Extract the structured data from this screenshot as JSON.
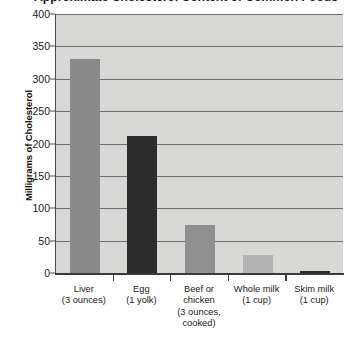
{
  "chart_data": {
    "type": "bar",
    "title": "Approximate Cholesterol Content of Common Foods",
    "title_note": "clipped at top edge of screenshot",
    "xlabel": "",
    "ylabel": "Milligrams of Cholesterol",
    "ylim": [
      0,
      400
    ],
    "ytick_values": [
      0,
      50,
      100,
      150,
      200,
      250,
      300,
      350,
      400
    ],
    "ytick_labels": [
      "0",
      "50",
      "100",
      "150",
      "200",
      "250",
      "300",
      "350",
      "400"
    ],
    "grid": true,
    "legend": "none",
    "categories": [
      "Liver\n(3 ounces)",
      "Egg\n(1 yolk)",
      "Beef or chicken\n(3 ounces, cooked)",
      "Whole milk\n(1 cup)",
      "Skim milk\n(1 cup)"
    ],
    "category_lines": [
      [
        "Liver",
        "(3 ounces)"
      ],
      [
        "Egg",
        "(1 yolk)"
      ],
      [
        "Beef or",
        "chicken",
        "(3 ounces,",
        "cooked)"
      ],
      [
        "Whole milk",
        "(1 cup)"
      ],
      [
        "Skim milk",
        "(1 cup)"
      ]
    ],
    "values": [
      330,
      212,
      74,
      28,
      3
    ],
    "bar_colors": [
      "#8a8a8a",
      "#2b2b2b",
      "#909090",
      "#b2b2b2",
      "#2b2b2b"
    ],
    "units": "mg"
  },
  "style": {
    "plot_background": "#d8d8d6",
    "gridline_color": "#6f6f6f",
    "axis_color": "#3a3a3a",
    "page_background": "#ffffff",
    "text_color": "#1a1a1a"
  }
}
